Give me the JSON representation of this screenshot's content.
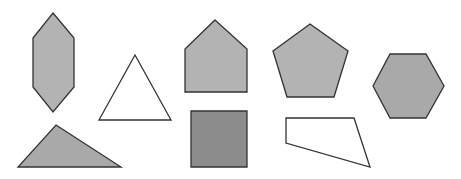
{
  "figure": {
    "width": 461,
    "height": 179,
    "background": "#ffffff",
    "stroke_color": "#333333"
  },
  "shapes": [
    {
      "id": "elongated-hexagon",
      "label": "Elongated hexagon",
      "fill": "#b3b3b3",
      "points": "53,13 74,38 74,87 53,112 33,87 33,38"
    },
    {
      "id": "equilateral-triangle",
      "label": "Equilateral triangle",
      "fill": "#ffffff",
      "points": "135,55 171,120 99,120"
    },
    {
      "id": "obtuse-triangle",
      "label": "Scalene triangle",
      "fill": "#a9a9a9",
      "points": "56,125 121,167 18,167"
    },
    {
      "id": "house-pentagon",
      "label": "House-shaped pentagon",
      "fill": "#b3b3b3",
      "points": "215,20 247,49 247,92 185,92 185,49"
    },
    {
      "id": "square",
      "label": "Square",
      "fill": "#8c8c8c",
      "points": "191,111 247,111 247,167 191,167"
    },
    {
      "id": "regular-pentagon",
      "label": "Regular pentagon",
      "fill": "#b3b3b3",
      "points": "310,24 348,51 334,97 287,97 273,51"
    },
    {
      "id": "regular-hexagon",
      "label": "Regular hexagon",
      "fill": "#a9a9a9",
      "points": "390,54 426,54 444,86 426,118 390,118 373,86"
    },
    {
      "id": "quadrilateral",
      "label": "Trapezium quadrilateral",
      "fill": "#ffffff",
      "points": "286,118 354,118 370,167 286,143"
    }
  ]
}
